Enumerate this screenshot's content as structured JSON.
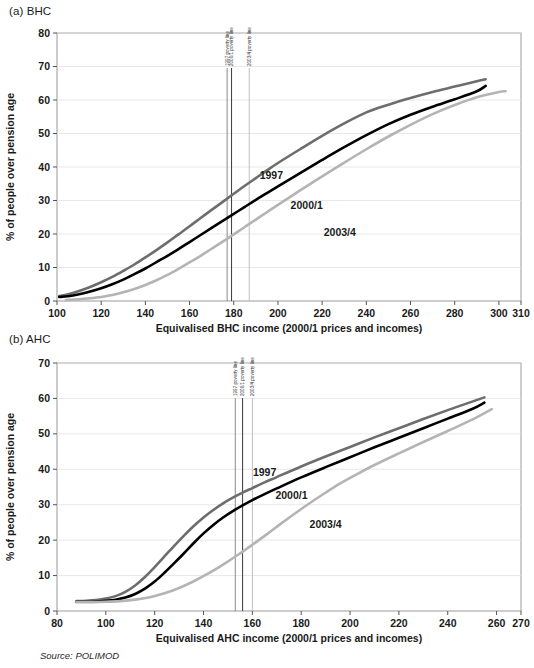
{
  "document": {
    "source_note": "Source: POLIMOD",
    "panel_a_caption": "(a) BHC",
    "panel_b_caption": "(b) AHC"
  },
  "colors": {
    "series_1997": "#6d6d6d",
    "series_2000_1": "#000000",
    "series_2003_4": "#b4b4b4",
    "gridline": "#e2e2e2",
    "frame": "#9a9a9a",
    "pov_1997": "#8a8a8a",
    "pov_2000_1": "#3a3a3a",
    "pov_2003_4": "#c0c0c0"
  },
  "chart_data": [
    {
      "id": "panel-a",
      "type": "line",
      "title": "(a) BHC",
      "xlabel": "Equivalised BHC income (2000/1 prices and incomes)",
      "ylabel": "% of people over pension age",
      "xlim": [
        100,
        310
      ],
      "ylim": [
        0,
        80
      ],
      "xticks": [
        100,
        120,
        140,
        160,
        180,
        200,
        220,
        240,
        260,
        280,
        300,
        310
      ],
      "yticks": [
        0,
        10,
        20,
        30,
        40,
        50,
        60,
        70,
        80
      ],
      "grid": true,
      "legend_position": "inline-annotations",
      "annotations": [
        {
          "text": "1997",
          "x": 197,
          "y": 36.5
        },
        {
          "text": "2000/1",
          "x": 213,
          "y": 27.5
        },
        {
          "text": "2003/4",
          "x": 228,
          "y": 19.5
        }
      ],
      "vlines": [
        {
          "label": "1997 poverty line",
          "x": 177,
          "color": "#8a8a8a"
        },
        {
          "label": "2000/1 poverty line",
          "x": 179,
          "color": "#3a3a3a"
        },
        {
          "label": "2003/4 poverty line",
          "x": 187,
          "color": "#c0c0c0"
        }
      ],
      "series": [
        {
          "name": "1997",
          "color": "#6d6d6d",
          "width": 2.6,
          "x": [
            101,
            105,
            110,
            115,
            120,
            125,
            130,
            135,
            140,
            145,
            150,
            155,
            160,
            165,
            170,
            175,
            180,
            185,
            190,
            195,
            200,
            210,
            220,
            230,
            240,
            250,
            260,
            270,
            280,
            290,
            294
          ],
          "values": [
            1.5,
            2.0,
            3.0,
            4.2,
            5.6,
            7.2,
            9.0,
            10.9,
            13.0,
            15.2,
            17.5,
            19.9,
            22.3,
            24.8,
            27.2,
            29.6,
            32.0,
            34.4,
            36.7,
            39.0,
            41.2,
            45.3,
            49.3,
            53.0,
            56.3,
            58.6,
            60.6,
            62.4,
            64.0,
            65.6,
            66.2
          ]
        },
        {
          "name": "2000/1",
          "color": "#000000",
          "width": 2.6,
          "x": [
            101,
            105,
            110,
            115,
            120,
            125,
            130,
            135,
            140,
            145,
            150,
            155,
            160,
            165,
            170,
            175,
            180,
            185,
            190,
            195,
            200,
            210,
            220,
            230,
            240,
            250,
            260,
            270,
            280,
            290,
            294
          ],
          "values": [
            1.2,
            1.4,
            2.0,
            2.8,
            3.8,
            5.0,
            6.4,
            8.0,
            9.7,
            11.6,
            13.5,
            15.5,
            17.6,
            19.7,
            21.8,
            23.9,
            26.0,
            28.1,
            30.2,
            32.2,
            34.2,
            38.2,
            42.1,
            45.9,
            49.5,
            52.8,
            55.6,
            58.0,
            60.2,
            62.6,
            64.2
          ]
        },
        {
          "name": "2003/4",
          "color": "#b4b4b4",
          "width": 2.6,
          "x": [
            104,
            110,
            115,
            120,
            125,
            130,
            135,
            140,
            145,
            150,
            155,
            160,
            165,
            170,
            175,
            180,
            185,
            190,
            195,
            200,
            210,
            220,
            230,
            240,
            250,
            260,
            270,
            280,
            290,
            300,
            303
          ],
          "values": [
            0.3,
            0.5,
            0.8,
            1.2,
            1.8,
            2.6,
            3.6,
            4.8,
            6.2,
            7.8,
            9.6,
            11.5,
            13.5,
            15.6,
            17.7,
            19.9,
            22.1,
            24.3,
            26.5,
            28.7,
            33.0,
            37.2,
            41.3,
            45.3,
            49.1,
            52.6,
            55.8,
            58.5,
            60.8,
            62.4,
            62.6
          ]
        }
      ]
    },
    {
      "id": "panel-b",
      "type": "line",
      "title": "(b) AHC",
      "xlabel": "Equivalised AHC income (2000/1 prices and incomes)",
      "ylabel": "% of people over pension age",
      "xlim": [
        80,
        270
      ],
      "ylim": [
        0,
        70
      ],
      "xticks": [
        80,
        100,
        120,
        140,
        160,
        180,
        200,
        220,
        240,
        260,
        270
      ],
      "yticks": [
        0,
        10,
        20,
        30,
        40,
        50,
        60,
        70
      ],
      "grid": true,
      "legend_position": "inline-annotations",
      "annotations": [
        {
          "text": "1997",
          "x": 165,
          "y": 38.0
        },
        {
          "text": "2000/1",
          "x": 176,
          "y": 31.5
        },
        {
          "text": "2003/4",
          "x": 190,
          "y": 23.5
        }
      ],
      "vlines": [
        {
          "label": "1997 poverty line",
          "x": 153,
          "color": "#8a8a8a"
        },
        {
          "label": "2000/1 poverty line",
          "x": 156,
          "color": "#3a3a3a"
        },
        {
          "label": "2003/4 poverty line",
          "x": 160,
          "color": "#c0c0c0"
        }
      ],
      "series": [
        {
          "name": "1997",
          "color": "#6d6d6d",
          "width": 2.6,
          "x": [
            88,
            92,
            96,
            100,
            104,
            108,
            112,
            116,
            120,
            124,
            128,
            132,
            136,
            140,
            144,
            148,
            152,
            156,
            160,
            165,
            170,
            180,
            190,
            200,
            210,
            220,
            230,
            240,
            250,
            255
          ],
          "values": [
            2.8,
            2.9,
            3.1,
            3.5,
            4.2,
            5.4,
            7.2,
            9.6,
            12.4,
            15.4,
            18.4,
            21.3,
            24.0,
            26.4,
            28.5,
            30.4,
            32.0,
            33.4,
            34.7,
            36.3,
            37.8,
            40.8,
            43.6,
            46.3,
            49.0,
            51.6,
            54.2,
            56.7,
            59.1,
            60.3
          ]
        },
        {
          "name": "2000/1",
          "color": "#000000",
          "width": 2.6,
          "x": [
            88,
            92,
            96,
            100,
            104,
            108,
            112,
            116,
            120,
            124,
            128,
            132,
            136,
            140,
            144,
            148,
            152,
            156,
            160,
            165,
            170,
            180,
            190,
            200,
            210,
            220,
            230,
            240,
            250,
            255
          ],
          "values": [
            2.6,
            2.6,
            2.7,
            2.9,
            3.2,
            3.8,
            4.8,
            6.3,
            8.3,
            10.8,
            13.5,
            16.3,
            19.2,
            21.9,
            24.3,
            26.4,
            28.2,
            29.8,
            31.3,
            33.0,
            34.6,
            37.7,
            40.6,
            43.4,
            46.2,
            48.9,
            51.6,
            54.3,
            57.0,
            58.8
          ]
        },
        {
          "name": "2003/4",
          "color": "#b4b4b4",
          "width": 2.6,
          "x": [
            88,
            94,
            100,
            106,
            112,
            118,
            124,
            130,
            136,
            142,
            148,
            154,
            160,
            166,
            172,
            178,
            184,
            190,
            196,
            202,
            210,
            220,
            230,
            240,
            250,
            258
          ],
          "values": [
            2.5,
            2.5,
            2.6,
            2.8,
            3.2,
            3.9,
            5.0,
            6.5,
            8.4,
            10.6,
            13.1,
            15.8,
            18.7,
            21.7,
            24.8,
            27.8,
            30.7,
            33.4,
            36.0,
            38.3,
            41.2,
            44.5,
            47.7,
            50.8,
            54.0,
            57.0
          ]
        }
      ]
    }
  ]
}
